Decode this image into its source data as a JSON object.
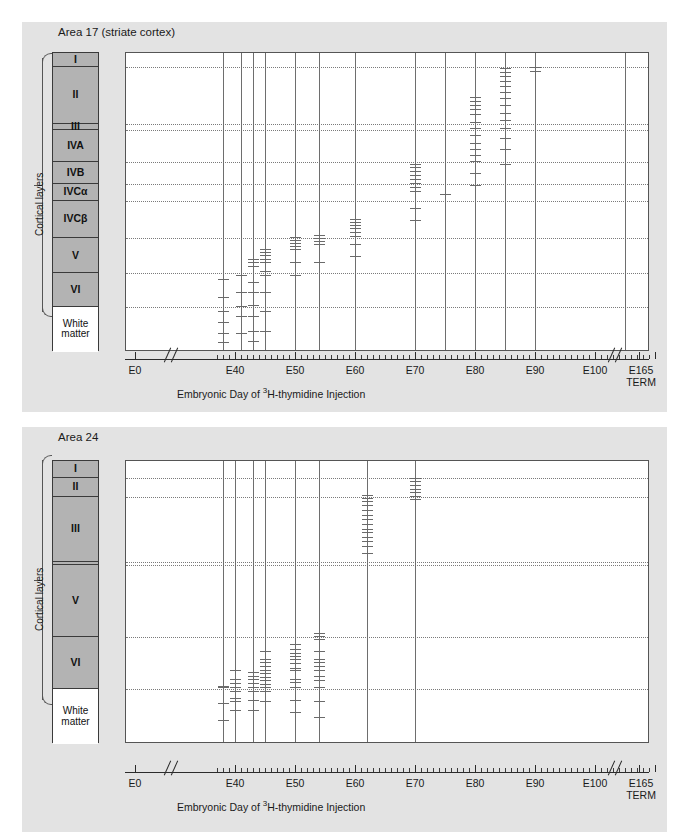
{
  "figure": {
    "background": "#ffffff",
    "panel_background": "#e3e3e3",
    "layer_fill": "#b3b3b3",
    "white_matter_fill": "#ffffff",
    "marker_color": "#6a6a6a"
  },
  "axis": {
    "caption_pre": "Embryonic Day of ",
    "caption_sup": "3",
    "caption_post": "H-thymidine Injection",
    "tick_labels": [
      "E0",
      "E40",
      "E50",
      "E60",
      "E70",
      "E80",
      "E90",
      "E100"
    ],
    "term_label_line1": "E165",
    "term_label_line2": "TERM",
    "range": [
      0,
      165
    ],
    "break_after": "E0",
    "break_before": "E165",
    "minor_tick_step": 1,
    "major_tick_step": 10
  },
  "brace": {
    "label": "Cortical layers"
  },
  "panels": [
    {
      "title": "Area 17 (striate cortex)",
      "layers": [
        {
          "label": "I",
          "top": 0,
          "height": 15
        },
        {
          "label": "II",
          "height": 60
        },
        {
          "label": "III",
          "height": 7
        },
        {
          "label": "IVA",
          "height": 34
        },
        {
          "label": "IVB",
          "height": 23
        },
        {
          "label": "IVCα",
          "height": 18
        },
        {
          "label": "IVCβ",
          "height": 40
        },
        {
          "label": "V",
          "height": 37
        },
        {
          "label": "VI",
          "height": 36
        },
        {
          "label": "White matter",
          "height": 48,
          "white": true
        }
      ],
      "chart_data": {
        "type": "scatter",
        "title": "Area 17 (striate cortex)",
        "xlabel": "Embryonic Day of 3H-thymidine Injection",
        "ylabel": "Cortical layers",
        "xlim": [
          0,
          165
        ],
        "grid": "dotted horizontal layer boundaries",
        "legend": "none",
        "series": [
          {
            "name": "E38",
            "x": 38,
            "y_depth_fractions": [
              0.755,
              0.815,
              0.862,
              0.9,
              0.935,
              0.967
            ]
          },
          {
            "name": "E41",
            "x": 41,
            "y_depth_fractions": [
              0.742,
              0.8,
              0.845,
              0.88,
              0.938
            ]
          },
          {
            "name": "E43",
            "x": 43,
            "y_depth_fractions": [
              0.69,
              0.7,
              0.712,
              0.765,
              0.8,
              0.843,
              0.88,
              0.93,
              0.962
            ]
          },
          {
            "name": "E45",
            "x": 45,
            "y_depth_fractions": [
              0.655,
              0.665,
              0.675,
              0.69,
              0.7,
              0.73,
              0.742,
              0.8,
              0.862,
              0.93
            ]
          },
          {
            "name": "E50",
            "x": 50,
            "y_depth_fractions": [
              0.615,
              0.625,
              0.635,
              0.645,
              0.655,
              0.7,
              0.742
            ]
          },
          {
            "name": "E54",
            "x": 54,
            "y_depth_fractions": [
              0.61,
              0.62,
              0.63,
              0.64,
              0.7
            ]
          },
          {
            "name": "E60",
            "x": 60,
            "y_depth_fractions": [
              0.555,
              0.565,
              0.575,
              0.585,
              0.598,
              0.612,
              0.64,
              0.68
            ]
          },
          {
            "name": "E70",
            "x": 70,
            "y_depth_fractions": [
              0.37,
              0.382,
              0.395,
              0.408,
              0.42,
              0.435,
              0.448,
              0.462,
              0.52,
              0.56
            ]
          },
          {
            "name": "E75",
            "x": 75,
            "y_depth_fractions": [
              0.47
            ]
          },
          {
            "name": "E80",
            "x": 80,
            "y_depth_fractions": [
              0.148,
              0.16,
              0.173,
              0.188,
              0.205,
              0.23,
              0.252,
              0.275,
              0.3,
              0.32,
              0.34,
              0.36,
              0.4,
              0.44
            ]
          },
          {
            "name": "E85",
            "x": 85,
            "y_depth_fractions": [
              0.05,
              0.063,
              0.078,
              0.095,
              0.112,
              0.13,
              0.15,
              0.175,
              0.2,
              0.225,
              0.25,
              0.285,
              0.32,
              0.37
            ]
          },
          {
            "name": "E90",
            "x": 90,
            "y_depth_fractions": [
              0.048,
              0.06
            ]
          },
          {
            "name": "E105",
            "x": 105,
            "y_depth_fractions": []
          }
        ],
        "vertical_injection_days": [
          38,
          41,
          43,
          45,
          50,
          54,
          60,
          70,
          75,
          80,
          85,
          90,
          105
        ]
      }
    },
    {
      "title": "Area 24",
      "layers": [
        {
          "label": "I",
          "height": 17
        },
        {
          "label": "II",
          "height": 19
        },
        {
          "label": "III",
          "height": 65
        },
        {
          "label": "",
          "height": 3
        },
        {
          "label": "V",
          "height": 72
        },
        {
          "label": "VI",
          "height": 52
        },
        {
          "label": "White matter",
          "height": 55,
          "white": true
        }
      ],
      "chart_data": {
        "type": "scatter",
        "title": "Area 24",
        "xlabel": "Embryonic Day of 3H-thymidine Injection",
        "ylabel": "Cortical layers",
        "xlim": [
          0,
          165
        ],
        "grid": "dotted horizontal layer boundaries",
        "legend": "none",
        "series": [
          {
            "name": "E38",
            "x": 38,
            "y_depth_fractions": [
              0.795,
              0.8,
              0.855,
              0.915
            ]
          },
          {
            "name": "E40",
            "x": 40,
            "y_depth_fractions": [
              0.74,
              0.772,
              0.785,
              0.8,
              0.812,
              0.838,
              0.848,
              0.88
            ]
          },
          {
            "name": "E43",
            "x": 43,
            "y_depth_fractions": [
              0.745,
              0.758,
              0.772,
              0.785,
              0.8,
              0.812,
              0.845,
              0.88
            ]
          },
          {
            "name": "E45",
            "x": 45,
            "y_depth_fractions": [
              0.672,
              0.7,
              0.712,
              0.725,
              0.738,
              0.75,
              0.762,
              0.775,
              0.788,
              0.8,
              0.812,
              0.848
            ]
          },
          {
            "name": "E50",
            "x": 50,
            "y_depth_fractions": [
              0.645,
              0.665,
              0.68,
              0.69,
              0.7,
              0.715,
              0.73,
              0.74,
              0.77,
              0.782,
              0.8,
              0.845,
              0.888
            ]
          },
          {
            "name": "E54",
            "x": 54,
            "y_depth_fractions": [
              0.608,
              0.618,
              0.63,
              0.672,
              0.7,
              0.712,
              0.725,
              0.74,
              0.76,
              0.775,
              0.8,
              0.848,
              0.905
            ]
          },
          {
            "name": "E62",
            "x": 62,
            "y_depth_fractions": [
              0.12,
              0.13,
              0.142,
              0.155,
              0.172,
              0.19,
              0.205,
              0.222,
              0.24,
              0.252,
              0.268,
              0.282,
              0.3,
              0.325
            ]
          },
          {
            "name": "E70",
            "x": 70,
            "y_depth_fractions": [
              0.06,
              0.072,
              0.085,
              0.098,
              0.11,
              0.122,
              0.135
            ]
          }
        ],
        "vertical_injection_days": [
          38,
          40,
          43,
          45,
          50,
          54,
          62,
          70
        ]
      }
    }
  ]
}
